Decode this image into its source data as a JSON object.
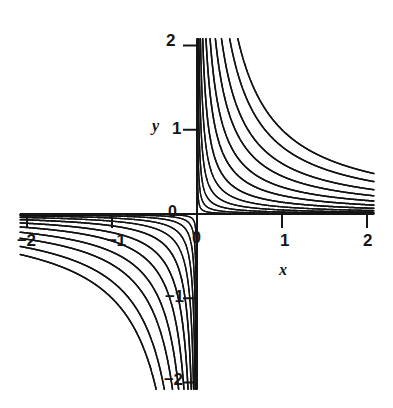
{
  "figure": {
    "background_color": "#ffffff",
    "line_color": "#111111",
    "axis_color": "#151515",
    "width": 393,
    "height": 408
  },
  "axis_names": {
    "x": "x",
    "y": "y"
  },
  "origin_markers": {
    "x_axis_zero": "0",
    "y_axis_zero": "0"
  },
  "ticks": {
    "x": [
      {
        "value": -2,
        "label": "−2",
        "px": 28
      },
      {
        "value": -1,
        "label": "−1",
        "px": 116
      },
      {
        "value": 0,
        "label": "0",
        "px": 197
      },
      {
        "value": 1,
        "label": "1",
        "px": 284
      },
      {
        "value": 2,
        "label": "2",
        "px": 368
      }
    ],
    "y": [
      {
        "value": -2,
        "label": "−2",
        "px": 382
      },
      {
        "value": -1,
        "label": "−1",
        "px": 297
      },
      {
        "value": 1,
        "label": "1",
        "px": 131
      },
      {
        "value": 2,
        "label": "2",
        "px": 45
      }
    ]
  },
  "chart_data": {
    "type": "line",
    "title": "",
    "subtitle": "",
    "xlabel": "x",
    "ylabel": "y",
    "xlim": [
      -2.08,
      2.08
    ],
    "ylim": [
      -2.08,
      2.08
    ],
    "xticks": [
      -2,
      -1,
      0,
      1,
      2
    ],
    "xticklabels": [
      "−2",
      "−1",
      "0",
      "1",
      "2"
    ],
    "yticks": [
      -2,
      -1,
      1,
      2
    ],
    "yticklabels": [
      "−2",
      "−1",
      "1",
      "2"
    ],
    "grid": false,
    "legend": "none",
    "axes_style": "centered-spines-through-origin",
    "family_equation": "x*y = c",
    "series": [
      {
        "name": "c = -1.00",
        "c": -1.0
      },
      {
        "name": "c = -0.80",
        "c": -0.8
      },
      {
        "name": "c = -0.60",
        "c": -0.6
      },
      {
        "name": "c = -0.45",
        "c": -0.45
      },
      {
        "name": "c = -0.32",
        "c": -0.32
      },
      {
        "name": "c = -0.22",
        "c": -0.22
      },
      {
        "name": "c = -0.14",
        "c": -0.14
      },
      {
        "name": "c = -0.085",
        "c": -0.085
      },
      {
        "name": "c = -0.048",
        "c": -0.048
      },
      {
        "name": "c = -0.024",
        "c": -0.024
      },
      {
        "name": "c = -0.010",
        "c": -0.01
      },
      {
        "name": "c = -0.003",
        "c": -0.003
      },
      {
        "name": "c = 0.003",
        "c": 0.003
      },
      {
        "name": "c = 0.010",
        "c": 0.01
      },
      {
        "name": "c = 0.024",
        "c": 0.024
      },
      {
        "name": "c = 0.048",
        "c": 0.048
      },
      {
        "name": "c = 0.085",
        "c": 0.085
      },
      {
        "name": "c = 0.14",
        "c": 0.14
      },
      {
        "name": "c = 0.22",
        "c": 0.22
      },
      {
        "name": "c = 0.32",
        "c": 0.32
      },
      {
        "name": "c = 0.45",
        "c": 0.45
      },
      {
        "name": "c = 0.60",
        "c": 0.6
      },
      {
        "name": "c = 0.80",
        "c": 0.8
      },
      {
        "name": "c = 1.00",
        "c": 1.0
      }
    ]
  }
}
